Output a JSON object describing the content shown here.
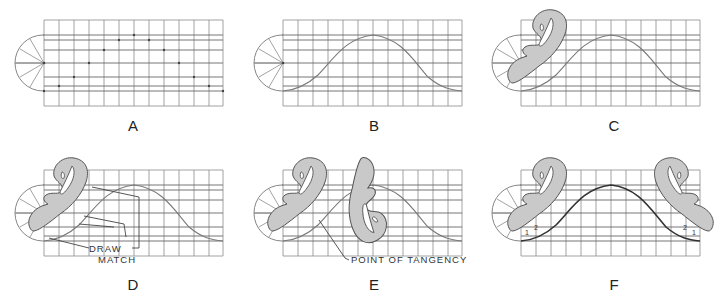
{
  "figure": {
    "panels": [
      {
        "id": "A",
        "label": "A",
        "caption": "Plotted points on grid"
      },
      {
        "id": "B",
        "label": "B",
        "caption": "Light freehand curve through points"
      },
      {
        "id": "C",
        "label": "C",
        "caption": "French curve fitted to first segment"
      },
      {
        "id": "D",
        "label": "D",
        "caption": "Draw and match portions",
        "callouts": [
          "DRAW",
          "MATCH"
        ]
      },
      {
        "id": "E",
        "label": "E",
        "caption": "Curve reversed at point of tangency",
        "callouts": [
          "POINT OF TANGENCY"
        ]
      },
      {
        "id": "F",
        "label": "F",
        "caption": "Symmetric segments marked",
        "marks": [
          "1",
          "2",
          "2",
          "1"
        ]
      }
    ],
    "grid": {
      "columns": 12,
      "column_width_px": 15,
      "rows_horizontal_lines": 9
    },
    "colors": {
      "grid": "#8a8a8a",
      "curve_fill": "#c9c9c9",
      "outline": "#555555",
      "text": "#222222"
    }
  }
}
